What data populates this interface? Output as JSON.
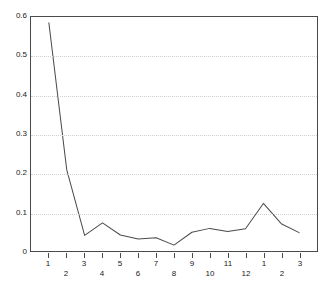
{
  "chart_data": {
    "type": "line",
    "title": "",
    "subtitle": "",
    "xlabel": "",
    "ylabel": "",
    "categories": [
      "1",
      "2",
      "3",
      "4",
      "5",
      "6",
      "7",
      "8",
      "9",
      "10",
      "11",
      "12",
      "1",
      "2",
      "3"
    ],
    "values": [
      0.585,
      0.208,
      0.04,
      0.072,
      0.041,
      0.031,
      0.034,
      0.015,
      0.048,
      0.058,
      0.05,
      0.057,
      0.122,
      0.07,
      0.047
    ],
    "series": [
      {
        "name": "series-1",
        "values": [
          0.585,
          0.208,
          0.04,
          0.072,
          0.041,
          0.031,
          0.034,
          0.015,
          0.048,
          0.058,
          0.05,
          0.057,
          0.122,
          0.07,
          0.047
        ],
        "color": "#4a4a4a"
      }
    ],
    "ylim": [
      0,
      0.6
    ],
    "yticks": [
      0,
      0.1,
      0.2,
      0.3,
      0.4,
      0.5,
      0.6
    ],
    "ytick_labels": [
      "0",
      "0.1",
      "0.2",
      "0.3",
      "0.4",
      "0.5",
      "0.6"
    ],
    "xtick_labels": [
      "1",
      "2",
      "3",
      "4",
      "5",
      "6",
      "7",
      "8",
      "9",
      "10",
      "11",
      "12",
      "1",
      "2",
      "3"
    ],
    "grid": true,
    "grid_axis": "y",
    "legend": false,
    "legend_position": "none",
    "annotations": [],
    "line_color": "#4a4a4a",
    "grid_color": "#cfcfcf",
    "axis_color": "#4a4a4a",
    "background_color": "#ffffff"
  }
}
